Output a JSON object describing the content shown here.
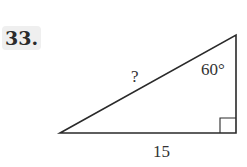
{
  "problem": {
    "number_label": "33."
  },
  "figure": {
    "type": "right-triangle",
    "hypotenuse_label": "?",
    "angle_label": "60°",
    "base_label": "15",
    "stroke_color": "#2a2a2a",
    "vertices": {
      "left": [
        60,
        133
      ],
      "top_right": [
        236,
        35
      ],
      "bottom_right": [
        236,
        133
      ]
    }
  }
}
